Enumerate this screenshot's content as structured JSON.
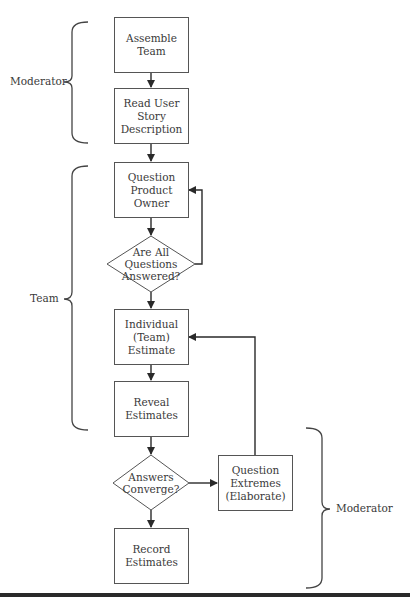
{
  "diagram": {
    "nodes": [
      {
        "id": "assemble",
        "type": "process",
        "label": "Assemble\nTeam"
      },
      {
        "id": "read",
        "type": "process",
        "label": "Read User\nStory\nDescription"
      },
      {
        "id": "question_po",
        "type": "process",
        "label": "Question\nProduct\nOwner"
      },
      {
        "id": "all_answered",
        "type": "decision",
        "label": "Are All\nQuestions\nAnswered?"
      },
      {
        "id": "individual",
        "type": "process",
        "label": "Individual\n(Team)\nEstimate"
      },
      {
        "id": "reveal",
        "type": "process",
        "label": "Reveal\nEstimates"
      },
      {
        "id": "converge",
        "type": "decision",
        "label": "Answers\nConverge?"
      },
      {
        "id": "extremes",
        "type": "process",
        "label": "Question\nExtremes\n(Elaborate)"
      },
      {
        "id": "record",
        "type": "process",
        "label": "Record\nEstimates"
      }
    ],
    "edges": [
      {
        "from": "assemble",
        "to": "read"
      },
      {
        "from": "read",
        "to": "question_po"
      },
      {
        "from": "question_po",
        "to": "all_answered"
      },
      {
        "from": "all_answered",
        "to": "question_po",
        "note": "loop back (right side)"
      },
      {
        "from": "all_answered",
        "to": "individual"
      },
      {
        "from": "individual",
        "to": "reveal"
      },
      {
        "from": "reveal",
        "to": "converge"
      },
      {
        "from": "converge",
        "to": "extremes"
      },
      {
        "from": "extremes",
        "to": "individual",
        "note": "loop back"
      },
      {
        "from": "converge",
        "to": "record"
      }
    ],
    "groups": [
      {
        "label": "Moderator",
        "side": "left",
        "covers": [
          "assemble",
          "read"
        ]
      },
      {
        "label": "Team",
        "side": "left",
        "covers": [
          "question_po",
          "all_answered",
          "individual",
          "reveal"
        ]
      },
      {
        "label": "Moderator",
        "side": "right",
        "covers": [
          "converge",
          "extremes",
          "record"
        ]
      }
    ]
  }
}
